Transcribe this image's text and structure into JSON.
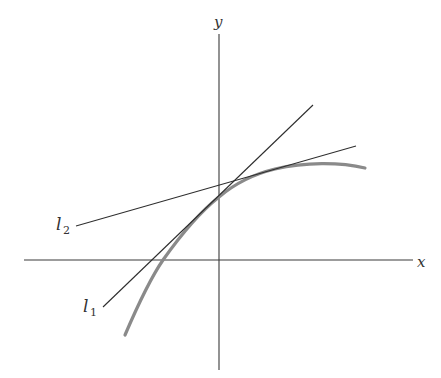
{
  "figure": {
    "axes": {
      "x_label": "x",
      "y_label": "y"
    },
    "lines": [
      {
        "id": "l1",
        "label_base": "l",
        "label_sub": "1",
        "description": "tangent line to curve at y-intercept"
      },
      {
        "id": "l2",
        "label_base": "l",
        "label_sub": "2",
        "description": "secant/line with smaller slope crossing y-axis above curve"
      }
    ],
    "curve": {
      "description": "concave-down increasing curve through the y-axis",
      "color": "#8a8a8a"
    },
    "colors": {
      "axes": "#3a3a3a",
      "lines": "#2e2e2e",
      "curve": "#8a8a8a",
      "background": "#ffffff"
    }
  }
}
